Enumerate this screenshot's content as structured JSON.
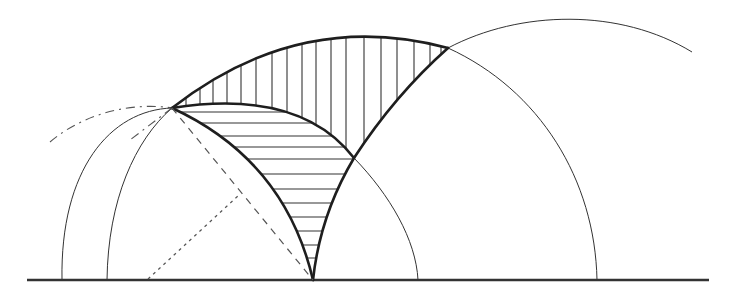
{
  "figure": {
    "colors": {
      "background": "#ffffff",
      "line": "#1e1e1e",
      "construction": "#555555"
    },
    "baseline": {
      "x1": 27,
      "x2": 709,
      "y": 280
    },
    "points": {
      "P": [
        172,
        108
      ],
      "O": [
        313,
        280
      ],
      "Q": [
        448,
        48
      ],
      "R": [
        354,
        158
      ],
      "M": [
        239,
        195
      ],
      "F": [
        148,
        279
      ]
    },
    "arcs": {
      "outer_left_thin": {
        "foot": [
          62,
          280
        ],
        "peak": [
          150,
          108
        ],
        "end": [
          172,
          108
        ]
      },
      "mid_left_thin": {
        "foot": [
          107,
          280
        ],
        "end": [
          172,
          108
        ]
      },
      "dashdot_left": {
        "start": [
          50,
          142
        ],
        "end": [
          172,
          108
        ]
      },
      "thick_P_to_O": {
        "start": [
          172,
          108
        ],
        "end": [
          313,
          280
        ]
      },
      "thick_O_to_Q": {
        "start": [
          313,
          280
        ],
        "end": [
          448,
          48
        ]
      },
      "thick_outer_top": {
        "start": [
          172,
          108
        ],
        "peak": [
          310,
          26
        ],
        "end": [
          448,
          48
        ]
      },
      "thick_inner_top": {
        "start": [
          172,
          108
        ],
        "peak": [
          240,
          96
        ],
        "end": [
          354,
          158
        ]
      },
      "thin_inner_continue": {
        "start": [
          354,
          158
        ],
        "foot": [
          418,
          280
        ]
      },
      "thin_right_mid": {
        "start": [
          448,
          48
        ],
        "foot": [
          597,
          280
        ]
      },
      "thin_far_right": {
        "start": [
          448,
          48
        ],
        "peak": [
          570,
          18
        ],
        "end": [
          692,
          52
        ]
      }
    },
    "hatching": {
      "vertical_region": "lune between outer top arc and inner top arc / right thick arc",
      "horizontal_region": "curved triangle P-R-O",
      "vertical_line_count": 18,
      "horizontal_line_count": 13
    }
  }
}
